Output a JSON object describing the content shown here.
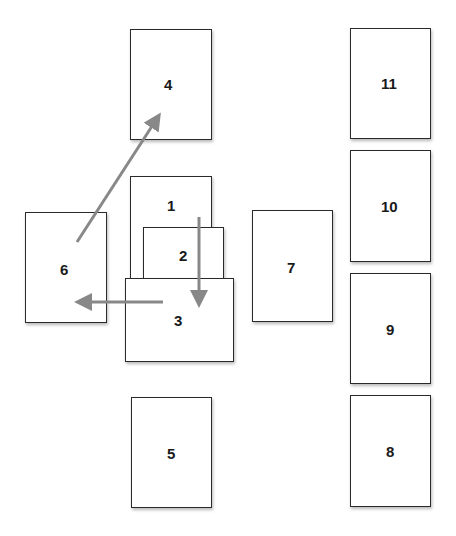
{
  "diagram": {
    "arrow_color": "#888888",
    "border_color": "#2a2a2a",
    "cards": [
      {
        "id": "4",
        "label": "4"
      },
      {
        "id": "11",
        "label": "11"
      },
      {
        "id": "1",
        "label": "1"
      },
      {
        "id": "10",
        "label": "10"
      },
      {
        "id": "6",
        "label": "6"
      },
      {
        "id": "2",
        "label": "2"
      },
      {
        "id": "7",
        "label": "7"
      },
      {
        "id": "3",
        "label": "3"
      },
      {
        "id": "9",
        "label": "9"
      },
      {
        "id": "5",
        "label": "5"
      },
      {
        "id": "8",
        "label": "8"
      }
    ],
    "arrows": [
      {
        "from": "6",
        "to": "4"
      },
      {
        "from": "1",
        "to": "3"
      },
      {
        "from": "3",
        "to": "6"
      }
    ]
  }
}
